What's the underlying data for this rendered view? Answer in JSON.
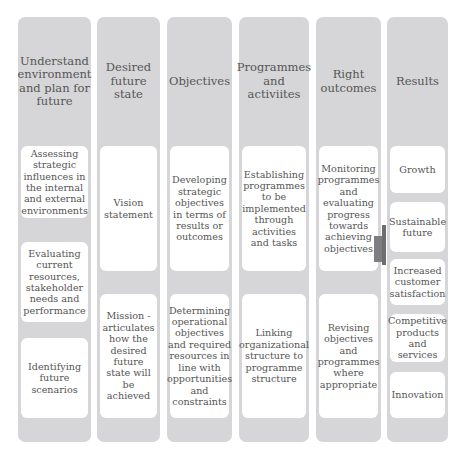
{
  "columns": [
    {
      "header": "Understand environment and plan for future",
      "boxes": [
        "Assessing strategic influences in the internal and external environments",
        "Evaluating current resources, stakeholder needs and performance",
        "Identifying future scenarios"
      ]
    },
    {
      "header": "Desired future state",
      "boxes": [
        "Vision statement",
        "Mission - articulates how the desired future state will be achieved"
      ]
    },
    {
      "header": "Objectives",
      "boxes": [
        "Developing strategic objectives in terms of results or outcomes",
        "Determining operational objectives and required resources in line with opportunities and constraints"
      ]
    },
    {
      "header": "Programmes and activiites",
      "boxes": [
        "Establishing programmes to be implemented through activities and tasks",
        "Linking organizational structure to programme structure"
      ]
    },
    {
      "header": "Right outcomes",
      "boxes": [
        "Monitoring programmes and evaluating progress towards achieving objectives",
        "Revising objectives and programmes where appropriate"
      ]
    },
    {
      "header": "Results",
      "boxes": [
        "Growth",
        "Sustainable future",
        "Increased customer satisfaction",
        "Competitive products and services",
        "Innovation"
      ]
    }
  ],
  "arrow": {
    "icon": "arrow-right-icon",
    "color": "#7e7e80"
  },
  "colors": {
    "column_bg": "#d6d6d8",
    "box_bg": "#ffffff",
    "text": "#555555"
  }
}
